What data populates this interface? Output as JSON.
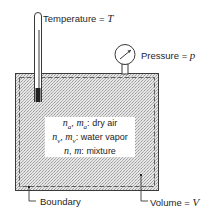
{
  "diagram": {
    "labels": {
      "temperature": {
        "text": "Temperature  =",
        "symbol": "T"
      },
      "pressure": {
        "text": "Pressure  =",
        "symbol": "p"
      },
      "boundary": {
        "text": "Boundary"
      },
      "volume": {
        "text": "Volume  =",
        "symbol": "V"
      }
    },
    "legend": [
      {
        "sym1": "n",
        "sub1": "a",
        "sym2": "m",
        "sub2": "a",
        "desc": "dry air"
      },
      {
        "sym1": "n",
        "sub1": "v",
        "sym2": "m",
        "sub2": "v",
        "desc": "water vapor"
      },
      {
        "sym1": "n",
        "sub1": "",
        "sym2": "m",
        "sub2": "",
        "desc": "mixture"
      }
    ],
    "colors": {
      "line": "#3a3a3a",
      "fill": "#d9d9d9",
      "dash": "#555555"
    }
  }
}
